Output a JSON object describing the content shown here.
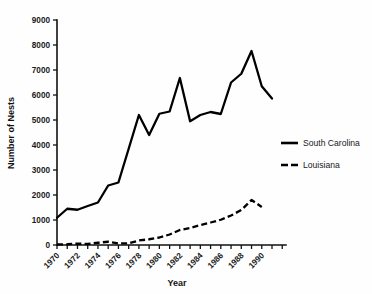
{
  "chart_data": {
    "type": "line",
    "title": "",
    "xlabel": "Year",
    "ylabel": "Number of Nests",
    "xlim": [
      1970,
      1991
    ],
    "ylim": [
      0,
      9000
    ],
    "grid": false,
    "legend_position": "right",
    "y_ticks": [
      0,
      1000,
      2000,
      3000,
      4000,
      5000,
      6000,
      7000,
      8000,
      9000
    ],
    "y_tick_labels": [
      "0",
      "1000",
      "2000",
      "3000",
      "4000",
      "5000",
      "6000",
      "7000",
      "8000",
      "9000"
    ],
    "x_ticks": [
      1970,
      1971,
      1972,
      1973,
      1974,
      1975,
      1976,
      1977,
      1978,
      1979,
      1980,
      1981,
      1982,
      1983,
      1984,
      1985,
      1986,
      1987,
      1988,
      1989,
      1990,
      1991
    ],
    "x_tick_labels": [
      "1970",
      "",
      "1972",
      "",
      "1974",
      "",
      "1976",
      "",
      "1978",
      "",
      "1980",
      "",
      "1982",
      "",
      "1984",
      "",
      "1986",
      "",
      "1988",
      "",
      "1990",
      ""
    ],
    "x": [
      1970,
      1971,
      1972,
      1973,
      1974,
      1975,
      1976,
      1977,
      1978,
      1979,
      1980,
      1981,
      1982,
      1983,
      1984,
      1985,
      1986,
      1987,
      1988,
      1989,
      1990,
      1991
    ],
    "series": [
      {
        "name": "South Carolina",
        "style": "solid",
        "color": "#000000",
        "values": [
          1090,
          1450,
          1410,
          1560,
          1700,
          2380,
          2500,
          3850,
          5200,
          4400,
          5250,
          5340,
          6680,
          4950,
          5200,
          5320,
          5240,
          6500,
          6850,
          7760,
          6350,
          5860
        ]
      },
      {
        "name": "Louisiana",
        "style": "dashed",
        "color": "#000000",
        "values": [
          20,
          30,
          55,
          40,
          90,
          130,
          60,
          70,
          180,
          230,
          300,
          420,
          600,
          680,
          800,
          900,
          1010,
          1180,
          1400,
          1800,
          1520,
          null
        ]
      }
    ]
  },
  "legend": {
    "entries": [
      {
        "label": "South Carolina",
        "style": "solid"
      },
      {
        "label": "Louisiana",
        "style": "dashed"
      }
    ]
  },
  "axes": {
    "x_title": "Year",
    "y_title": "Number of Nests"
  }
}
